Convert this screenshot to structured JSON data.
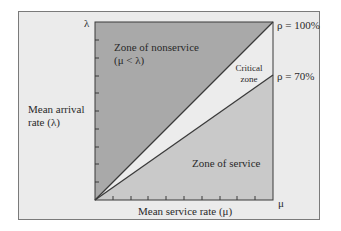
{
  "diagram": {
    "axis": {
      "y_label_line1": "Mean arrival",
      "y_label_line2": "rate (λ)",
      "y_max_symbol": "λ",
      "x_label": "Mean service rate (μ)",
      "x_max_symbol": "μ"
    },
    "zones": {
      "nonservice_line1": "Zone of nonservice",
      "nonservice_line2": "(μ < λ)",
      "critical_line1": "Critical",
      "critical_line2": "zone",
      "service": "Zone of service"
    },
    "lines": {
      "rho_100": "ρ = 100%",
      "rho_70": "ρ = 70%"
    },
    "colors": {
      "frame_bg": "#ebebeb",
      "nonservice": "#a9a9a9",
      "critical": "#ececec",
      "service": "#c9c9c9",
      "line": "#3a3a3a"
    },
    "ticks": {
      "x_count": 9,
      "y_count": 9
    }
  }
}
